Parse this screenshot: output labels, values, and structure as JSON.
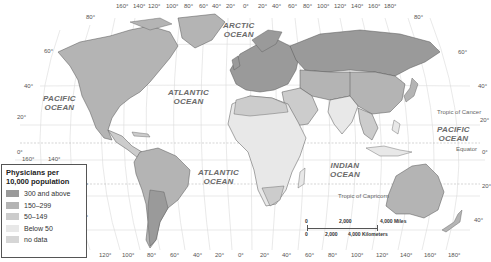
{
  "map": {
    "title": "Physicians per 10,000 population",
    "colors": {
      "water": "#ffffff",
      "grid": "#d8d8d8",
      "border": "#555555",
      "cat_300_above": "#9a9a9a",
      "cat_150_299": "#b4b4b4",
      "cat_50_149": "#cccccc",
      "cat_below_50": "#e8e8e8",
      "no_data": "#d6d6d6"
    },
    "oceans": [
      {
        "name": "ARCTIC",
        "line2": "OCEAN"
      },
      {
        "name": "PACIFIC",
        "line2": "OCEAN"
      },
      {
        "name": "ATLANTIC",
        "line2": "OCEAN"
      },
      {
        "name": "PACIFIC",
        "line2": "OCEAN"
      },
      {
        "name": "ATLANTIC",
        "line2": "OCEAN"
      },
      {
        "name": "INDIAN",
        "line2": "OCEAN"
      }
    ],
    "lines": {
      "tropic_cancer": "Tropic of Cancer",
      "equator": "Equator",
      "tropic_capricorn": "Tropic of Capricorn"
    },
    "top_longitudes": [
      "160°",
      "140°",
      "120°",
      "100°",
      "80°",
      "60°",
      "40°",
      "20°",
      "0°",
      "20°",
      "40°",
      "60°",
      "80°",
      "100°",
      "120°",
      "140°",
      "160°",
      "180°"
    ],
    "bottom_longitudes": [
      "120°",
      "100°",
      "80°",
      "60°",
      "40°",
      "20°",
      "0°",
      "20°",
      "40°",
      "60°",
      "80°",
      "100°",
      "120°",
      "140°",
      "160°",
      "180°"
    ],
    "left_pacific_longitudes": [
      "160°",
      "140°"
    ],
    "latitudes_left": [
      "80°",
      "60°",
      "40°",
      "20°",
      "0°",
      "20°",
      "40°"
    ],
    "latitudes_right": [
      "80°",
      "60°",
      "40°",
      "20°",
      "0°",
      "20°",
      "40°"
    ],
    "scale": {
      "miles": [
        "0",
        "2,000",
        "4,000 Miles"
      ],
      "km": [
        "0",
        "2,000",
        "4,000 Kilometers"
      ]
    }
  },
  "legend": {
    "title_line1": "Physicians per",
    "title_line2": "10,000 population",
    "items": [
      {
        "label": "300 and above",
        "color": "#9a9a9a"
      },
      {
        "label": "150–299",
        "color": "#b4b4b4"
      },
      {
        "label": "50–149",
        "color": "#cccccc"
      },
      {
        "label": "Below 50",
        "color": "#e8e8e8"
      },
      {
        "label": "no data",
        "color": "#d6d6d6"
      }
    ]
  }
}
